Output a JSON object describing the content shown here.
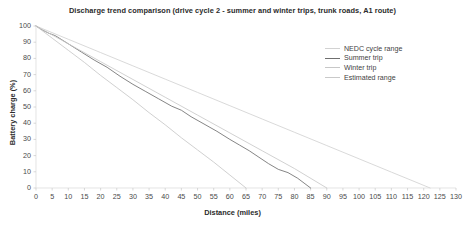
{
  "chart_data": {
    "type": "line",
    "title": "Discharge trend comparison (drive cycle 2 - summer and winter trips, trunk roads, A1 route)",
    "xlabel": "Distance (miles)",
    "ylabel": "Battery charge (%)",
    "xlim": [
      0,
      130
    ],
    "ylim": [
      0,
      100
    ],
    "grid": false,
    "legend_position": "top-right",
    "xticks": [
      0,
      5,
      10,
      15,
      20,
      25,
      30,
      35,
      40,
      45,
      50,
      55,
      60,
      65,
      70,
      75,
      80,
      85,
      90,
      95,
      100,
      105,
      110,
      115,
      120,
      125,
      130
    ],
    "yticks": [
      0,
      10,
      20,
      30,
      40,
      50,
      60,
      70,
      80,
      90,
      100
    ],
    "series": [
      {
        "name": "NEDC cycle range",
        "color": "#d2d2d2",
        "x": [
          0,
          10,
          20,
          30,
          40,
          50,
          60,
          70,
          80,
          90,
          100,
          110,
          122
        ],
        "y": [
          100,
          91.8,
          83.6,
          75.4,
          67.2,
          59.0,
          50.8,
          42.6,
          34.4,
          26.2,
          18.0,
          9.8,
          0
        ]
      },
      {
        "name": "Summer trip",
        "color": "#6f6f6f",
        "x": [
          0,
          2,
          4,
          6,
          8,
          10,
          14,
          18,
          22,
          26,
          30,
          34,
          38,
          42,
          45,
          48,
          52,
          56,
          60,
          63,
          66,
          69,
          72,
          75,
          78,
          81,
          85
        ],
        "y": [
          100,
          97.5,
          95.5,
          94.0,
          91.5,
          89.0,
          84.0,
          79.0,
          74.5,
          69.0,
          64.0,
          59.5,
          55.0,
          50.5,
          48.0,
          44.0,
          39.5,
          35.0,
          30.0,
          26.5,
          23.0,
          19.0,
          15.0,
          11.5,
          9.5,
          6.0,
          0
        ]
      },
      {
        "name": "Winter trip",
        "color": "#c7c7c7",
        "x": [
          0,
          5,
          10,
          15,
          20,
          25,
          30,
          35,
          40,
          45,
          50,
          55,
          60,
          65
        ],
        "y": [
          100,
          92.5,
          85.0,
          77.5,
          69.5,
          62.0,
          54.5,
          46.5,
          39.0,
          31.0,
          23.5,
          16.0,
          8.0,
          0
        ]
      },
      {
        "name": "Estimated range",
        "color": "#c9c9c9",
        "x": [
          0,
          10,
          20,
          30,
          40,
          50,
          60,
          70,
          80,
          90
        ],
        "y": [
          100,
          89.0,
          78.0,
          67.0,
          56.0,
          45.0,
          34.0,
          23.0,
          12.0,
          0
        ]
      }
    ]
  },
  "legend": {
    "items": [
      {
        "label": "NEDC cycle range"
      },
      {
        "label": "Summer trip"
      },
      {
        "label": "Winter trip"
      },
      {
        "label": "Estimated range"
      }
    ]
  }
}
